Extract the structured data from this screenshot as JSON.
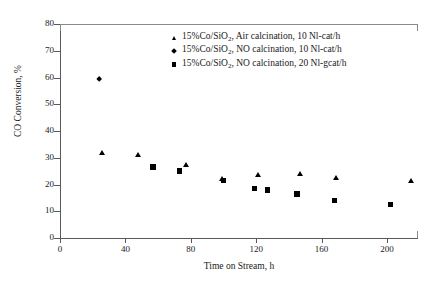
{
  "chart_data": {
    "type": "scatter",
    "title": "",
    "xlabel": "Time on Stream, h",
    "ylabel": "CO Conversion, %",
    "xlim": [
      0,
      219
    ],
    "ylim": [
      0,
      80
    ],
    "xticks": [
      0,
      40,
      80,
      120,
      160,
      200
    ],
    "yticks": [
      0,
      10,
      20,
      30,
      40,
      50,
      60,
      70,
      80
    ],
    "grid": false,
    "legend_position": "top-center",
    "series": [
      {
        "name": "15%Co/SiO2, Air calcination, 10 Nl-cat/h",
        "marker": "triangle",
        "color": "#000000",
        "points": [
          {
            "x": 26,
            "y": 32
          },
          {
            "x": 48,
            "y": 31
          },
          {
            "x": 77,
            "y": 27.5
          },
          {
            "x": 99,
            "y": 22
          },
          {
            "x": 121,
            "y": 23.5
          },
          {
            "x": 147,
            "y": 24
          },
          {
            "x": 169,
            "y": 22.5
          },
          {
            "x": 215,
            "y": 21.5
          }
        ]
      },
      {
        "name": "15%Co/SiO2, NO calcination, 10 Nl-cat/h",
        "marker": "diamond",
        "color": "#000000",
        "points": [
          {
            "x": 24,
            "y": 59.5
          }
        ]
      },
      {
        "name": "15%Co/SiO2, NO calcination, 20 Nl-gcat/h",
        "marker": "square",
        "color": "#000000",
        "points": [
          {
            "x": 57,
            "y": 26.5
          },
          {
            "x": 73,
            "y": 25
          },
          {
            "x": 100,
            "y": 21.5
          },
          {
            "x": 119,
            "y": 18.5
          },
          {
            "x": 127,
            "y": 18
          },
          {
            "x": 145,
            "y": 16.5
          },
          {
            "x": 168,
            "y": 14
          },
          {
            "x": 202,
            "y": 12.5
          }
        ]
      }
    ]
  },
  "axis": {
    "y_tick_labels": [
      "0",
      "10",
      "20",
      "30",
      "40",
      "50",
      "60",
      "70",
      "80"
    ],
    "x_tick_labels": [
      "0",
      "40",
      "80",
      "120",
      "160",
      "200"
    ],
    "y_title": "CO Conversion, %",
    "x_title": "Time on Stream, h"
  },
  "legend": {
    "entries": [
      {
        "marker": "triangle-marker",
        "prefix": "15%Co/SiO",
        "sub": "2",
        "suffix": ", Air calcination, 10 Nl-cat/h"
      },
      {
        "marker": "diamond-marker",
        "prefix": "15%Co/SiO",
        "sub": "2",
        "suffix": ", NO calcination, 10 Nl-cat/h"
      },
      {
        "marker": "square-marker",
        "prefix": "15%Co/SiO",
        "sub": "2",
        "suffix": ", NO calcination, 20 Nl-gcat/h"
      }
    ]
  }
}
